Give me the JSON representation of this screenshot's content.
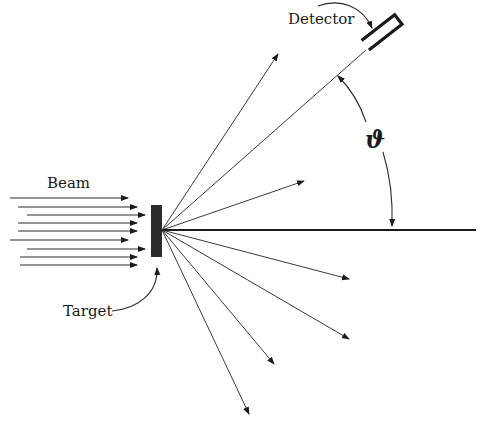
{
  "diagram": {
    "labels": {
      "beam": "Beam",
      "target": "Target",
      "detector": "Detector",
      "angle": "ϑ"
    },
    "colors": {
      "ink": "#1a1a1a",
      "line": "#3a3a3a",
      "target_fill": "#2b2b2b",
      "background": "#ffffff"
    },
    "beam_arrows": [
      {
        "x1": 10,
        "x2": 128,
        "y": 198
      },
      {
        "x1": 18,
        "x2": 137,
        "y": 207
      },
      {
        "x1": 27,
        "x2": 145,
        "y": 215
      },
      {
        "x1": 18,
        "x2": 137,
        "y": 223
      },
      {
        "x1": 18,
        "x2": 137,
        "y": 231
      },
      {
        "x1": 10,
        "x2": 128,
        "y": 240
      },
      {
        "x1": 27,
        "x2": 145,
        "y": 249
      },
      {
        "x1": 20,
        "x2": 137,
        "y": 257
      },
      {
        "x1": 20,
        "x2": 137,
        "y": 265
      }
    ],
    "target": {
      "x": 151,
      "y": 205,
      "width": 11,
      "height": 52
    },
    "scatter_origin": {
      "x": 162,
      "y": 230
    },
    "scattered_rays": [
      {
        "x2": 278,
        "y2": 54,
        "arrow": true
      },
      {
        "x2": 304,
        "y2": 181,
        "arrow": true
      },
      {
        "x2": 349,
        "y2": 279,
        "arrow": true
      },
      {
        "x2": 349,
        "y2": 339,
        "arrow": true
      },
      {
        "x2": 274,
        "y2": 364,
        "arrow": true
      },
      {
        "x2": 249,
        "y2": 414,
        "arrow": true
      }
    ],
    "detector_ray": {
      "x2": 366,
      "y2": 50
    },
    "reference_axis": {
      "x2": 476,
      "y2": 230
    },
    "angle_arc": {
      "from": "detector direction",
      "to": "beam axis"
    }
  }
}
